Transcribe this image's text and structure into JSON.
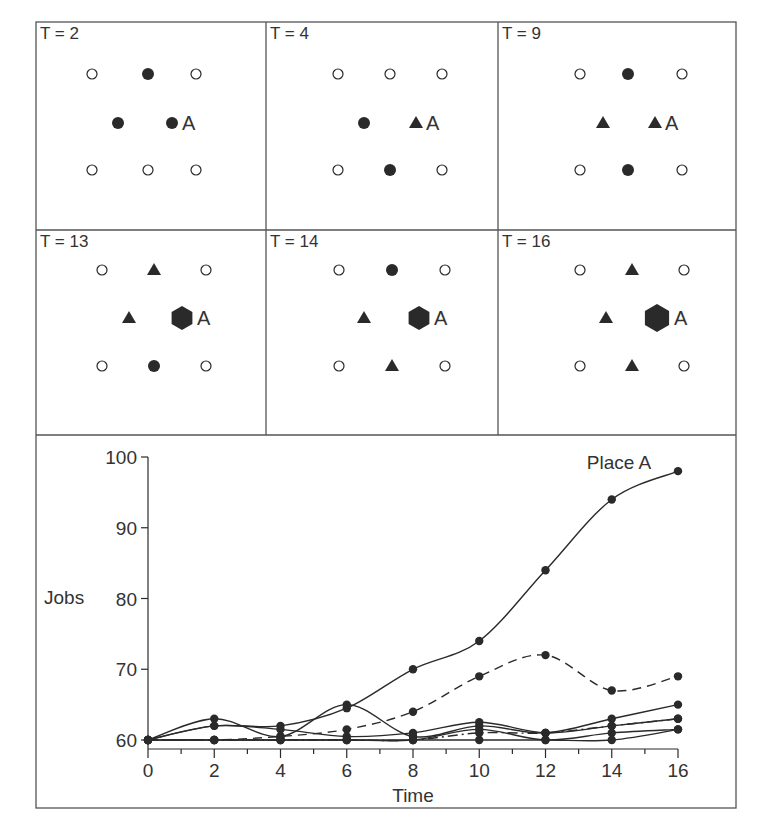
{
  "figure": {
    "panels": [
      {
        "label": "T = 2",
        "place_label": "A",
        "markers": [
          {
            "row": 0,
            "col": 0,
            "type": "open-circle"
          },
          {
            "row": 0,
            "col": 1,
            "type": "filled-circle"
          },
          {
            "row": 0,
            "col": 2,
            "type": "open-circle"
          },
          {
            "row": 1,
            "col": 0,
            "type": "filled-circle"
          },
          {
            "row": 1,
            "col": 1,
            "type": "filled-circle",
            "place": "A"
          },
          {
            "row": 2,
            "col": 0,
            "type": "open-circle"
          },
          {
            "row": 2,
            "col": 1,
            "type": "open-circle"
          },
          {
            "row": 2,
            "col": 2,
            "type": "open-circle"
          }
        ]
      },
      {
        "label": "T = 4",
        "place_label": "A",
        "markers": [
          {
            "row": 0,
            "col": 0,
            "type": "open-circle"
          },
          {
            "row": 0,
            "col": 1,
            "type": "open-circle"
          },
          {
            "row": 0,
            "col": 2,
            "type": "open-circle"
          },
          {
            "row": 1,
            "col": 0,
            "type": "filled-circle"
          },
          {
            "row": 1,
            "col": 1,
            "type": "filled-triangle",
            "place": "A"
          },
          {
            "row": 2,
            "col": 0,
            "type": "open-circle"
          },
          {
            "row": 2,
            "col": 1,
            "type": "filled-circle"
          },
          {
            "row": 2,
            "col": 2,
            "type": "open-circle"
          }
        ]
      },
      {
        "label": "T = 9",
        "place_label": "A",
        "markers": [
          {
            "row": 0,
            "col": 0,
            "type": "open-circle"
          },
          {
            "row": 0,
            "col": 1,
            "type": "filled-circle"
          },
          {
            "row": 0,
            "col": 2,
            "type": "open-circle"
          },
          {
            "row": 1,
            "col": 0,
            "type": "filled-triangle"
          },
          {
            "row": 1,
            "col": 1,
            "type": "filled-triangle",
            "place": "A"
          },
          {
            "row": 2,
            "col": 0,
            "type": "open-circle"
          },
          {
            "row": 2,
            "col": 1,
            "type": "filled-circle"
          },
          {
            "row": 2,
            "col": 2,
            "type": "open-circle"
          }
        ]
      },
      {
        "label": "T = 13",
        "place_label": "A",
        "markers": [
          {
            "row": 0,
            "col": 0,
            "type": "open-circle"
          },
          {
            "row": 0,
            "col": 1,
            "type": "filled-triangle"
          },
          {
            "row": 0,
            "col": 2,
            "type": "open-circle"
          },
          {
            "row": 1,
            "col": 0,
            "type": "filled-triangle"
          },
          {
            "row": 1,
            "col": 1,
            "type": "filled-hexagon",
            "place": "A"
          },
          {
            "row": 2,
            "col": 0,
            "type": "open-circle"
          },
          {
            "row": 2,
            "col": 1,
            "type": "filled-circle"
          },
          {
            "row": 2,
            "col": 2,
            "type": "open-circle"
          }
        ]
      },
      {
        "label": "T = 14",
        "place_label": "A",
        "markers": [
          {
            "row": 0,
            "col": 0,
            "type": "open-circle"
          },
          {
            "row": 0,
            "col": 1,
            "type": "filled-circle"
          },
          {
            "row": 0,
            "col": 2,
            "type": "open-circle"
          },
          {
            "row": 1,
            "col": 0,
            "type": "filled-triangle"
          },
          {
            "row": 1,
            "col": 1,
            "type": "filled-hexagon",
            "place": "A"
          },
          {
            "row": 2,
            "col": 0,
            "type": "open-circle"
          },
          {
            "row": 2,
            "col": 1,
            "type": "filled-triangle"
          },
          {
            "row": 2,
            "col": 2,
            "type": "open-circle"
          }
        ]
      },
      {
        "label": "T = 16",
        "place_label": "A",
        "markers": [
          {
            "row": 0,
            "col": 0,
            "type": "open-circle"
          },
          {
            "row": 0,
            "col": 1,
            "type": "filled-triangle"
          },
          {
            "row": 0,
            "col": 2,
            "type": "open-circle"
          },
          {
            "row": 1,
            "col": 0,
            "type": "filled-triangle"
          },
          {
            "row": 1,
            "col": 1,
            "type": "filled-hexagon",
            "place": "A"
          },
          {
            "row": 2,
            "col": 0,
            "type": "open-circle"
          },
          {
            "row": 2,
            "col": 1,
            "type": "filled-triangle"
          },
          {
            "row": 2,
            "col": 2,
            "type": "open-circle"
          }
        ]
      }
    ],
    "colors": {
      "ink": "#2a2a2a",
      "frame": "#555555",
      "background": "#ffffff"
    }
  },
  "chart_data": {
    "type": "line",
    "title": "",
    "xlabel": "Time",
    "ylabel": "Jobs",
    "xlim": [
      0,
      16
    ],
    "ylim": [
      60,
      100
    ],
    "x_ticks": [
      0,
      2,
      4,
      6,
      8,
      10,
      12,
      14,
      16
    ],
    "y_ticks": [
      60,
      70,
      80,
      90,
      100
    ],
    "grid": false,
    "legend": null,
    "annotations": [
      {
        "text": "Place A",
        "x": 16,
        "y": 98
      }
    ],
    "x": [
      0,
      2,
      4,
      6,
      8,
      10,
      12,
      14,
      16
    ],
    "series": [
      {
        "name": "Place A",
        "style": "solid",
        "values": [
          60,
          62,
          62,
          64.5,
          70,
          74,
          84,
          94,
          98
        ]
      },
      {
        "name": "Place 2",
        "style": "dashed",
        "values": [
          60,
          60,
          60.5,
          61.5,
          64,
          69,
          72,
          67,
          69
        ]
      },
      {
        "name": "Place 3",
        "style": "solid",
        "values": [
          60,
          63,
          60.5,
          65,
          60.5,
          62,
          61,
          63,
          65
        ]
      },
      {
        "name": "Place 4",
        "style": "dash-dot",
        "values": [
          60,
          60,
          60,
          60,
          60,
          61,
          61,
          62,
          63
        ]
      },
      {
        "name": "Place 5",
        "style": "solid",
        "values": [
          60,
          62,
          61.5,
          60.5,
          61,
          62.5,
          61,
          62,
          63
        ]
      },
      {
        "name": "Place 6",
        "style": "solid",
        "values": [
          60,
          60,
          60,
          60,
          60,
          61.5,
          60,
          61,
          61.5
        ]
      },
      {
        "name": "Place 7",
        "style": "solid",
        "values": [
          60,
          60,
          60,
          60,
          60,
          60,
          60,
          60,
          61.5
        ]
      }
    ]
  }
}
